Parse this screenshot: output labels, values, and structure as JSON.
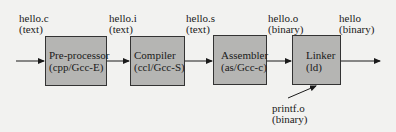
{
  "diagram": {
    "inputs": [
      {
        "name": "hello.c",
        "type": "(text)"
      },
      {
        "name": "hello.i",
        "type": "(text)"
      },
      {
        "name": "hello.s",
        "type": "(text)"
      },
      {
        "name": "hello.o",
        "type": "(binary)"
      },
      {
        "name": "hello",
        "type": "(binary)"
      }
    ],
    "stages": [
      {
        "name": "Pre-processor",
        "tool": "(cpp/Gcc-E)"
      },
      {
        "name": "Compiler",
        "tool": "(ccl/Gcc-S)"
      },
      {
        "name": "Assembler",
        "tool": "(as/Gcc-c)"
      },
      {
        "name": "Linker",
        "tool": "(ld)"
      }
    ],
    "extra_input": {
      "name": "printf.o",
      "type": "(binary)"
    },
    "colors": {
      "box_fill": "#b5b5b3",
      "line": "#1a1a1a",
      "background": "#f2f2f0"
    }
  }
}
